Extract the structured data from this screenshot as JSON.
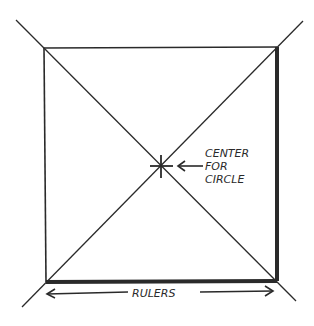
{
  "diagram": {
    "type": "square-with-diagonals",
    "labels": {
      "center_line1": "CENTER",
      "center_line2": "FOR",
      "center_line3": "CIRCLE",
      "bottom": "RULERS"
    },
    "colors": {
      "ink": "#2a2a2a",
      "background": "#ffffff"
    }
  }
}
